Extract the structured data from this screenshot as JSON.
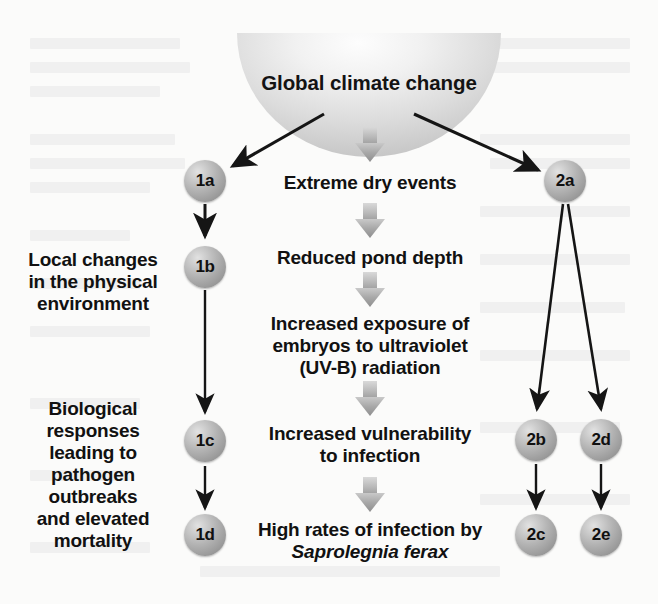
{
  "figure": {
    "title": "Global climate change",
    "background_color": "#fbfbfa",
    "badge_color": "#a8a8a8",
    "arrow_color": "#151515",
    "block_arrow_color": "#a8a8a8"
  },
  "center_column": {
    "steps": [
      {
        "id": "extreme-dry-events",
        "text": "Extreme dry events"
      },
      {
        "id": "reduced-pond-depth",
        "text": "Reduced pond depth"
      },
      {
        "id": "increased-uv-exposure",
        "line1": "Increased exposure of",
        "line2": "embryos to ultraviolet",
        "line3": "(UV-B) radiation"
      },
      {
        "id": "increased-vulnerability",
        "line1": "Increased vulnerability",
        "line2": "to infection"
      },
      {
        "id": "high-rates-infection",
        "line1": "High rates of infection by",
        "line2": "Saprolegnia ferax"
      }
    ]
  },
  "left_column": {
    "labels": [
      {
        "id": "local-changes",
        "line1": "Local changes",
        "line2": "in the physical",
        "line3": "environment"
      },
      {
        "id": "biological-responses",
        "line1": "Biological",
        "line2": "responses",
        "line3": "leading to",
        "line4": "pathogen",
        "line5": "outbreaks",
        "line6": "and elevated",
        "line7": "mortality"
      }
    ]
  },
  "badges": {
    "b1a": "1a",
    "b1b": "1b",
    "b1c": "1c",
    "b1d": "1d",
    "b2a": "2a",
    "b2b": "2b",
    "b2c": "2c",
    "b2d": "2d",
    "b2e": "2e"
  }
}
